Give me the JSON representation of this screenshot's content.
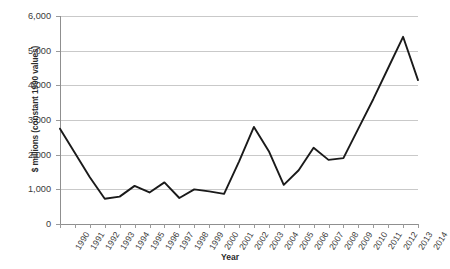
{
  "chart_data": {
    "type": "line",
    "title": "",
    "xlabel": "Year",
    "ylabel": "$ millions (constant 1990 values)",
    "categories": [
      "1990",
      "1991",
      "1992",
      "1993",
      "1994",
      "1995",
      "1996",
      "1997",
      "1998",
      "1999",
      "2000",
      "2001",
      "2002",
      "2003",
      "2004",
      "2005",
      "2006",
      "2007",
      "2008",
      "2009",
      "2010",
      "2011",
      "2012",
      "2013",
      "2014"
    ],
    "values": [
      2750,
      2050,
      1350,
      730,
      790,
      1100,
      910,
      1200,
      750,
      1000,
      940,
      870,
      1800,
      2800,
      2100,
      1130,
      1550,
      2200,
      1850,
      1900,
      2750,
      3600,
      4500,
      5400,
      4150
    ],
    "ylim": [
      0,
      6000
    ],
    "ytick_labels": [
      "0",
      "1,000",
      "2,000",
      "3,000",
      "4,000",
      "5,000",
      "6,000"
    ],
    "ytick_values": [
      0,
      1000,
      2000,
      3000,
      4000,
      5000,
      6000
    ],
    "grid": true,
    "legend": "none",
    "series_color": "#1a1a1a",
    "gridline_color": "#c9c9c9",
    "background_color": "#ffffff"
  }
}
